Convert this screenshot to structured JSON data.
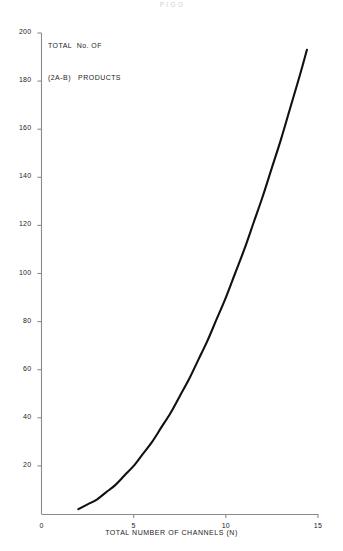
{
  "page": {
    "header_fragment": "P        I        G         G"
  },
  "chart_data": {
    "type": "line",
    "title": "TOTAL  No. OF\n(2A-B)   PRODUCTS",
    "title_lines": [
      "TOTAL  No. OF",
      "(2A-B)   PRODUCTS"
    ],
    "xlabel": "TOTAL  NUMBER OF  CHANNELS  (N)",
    "ylabel": "",
    "xlim": [
      0,
      15
    ],
    "ylim": [
      0,
      200
    ],
    "grid": false,
    "legend": null,
    "xticks": [
      0,
      5,
      10,
      15
    ],
    "xtick_labels": [
      "0",
      "5",
      "10",
      "15"
    ],
    "yticks": [
      0,
      20,
      40,
      60,
      80,
      100,
      120,
      140,
      160,
      180,
      200
    ],
    "ytick_labels": [
      "0",
      "20",
      "40",
      "60",
      "80",
      "100",
      "120",
      "140",
      "160",
      "180",
      "200"
    ],
    "series": [
      {
        "name": "(2A-B) products",
        "color": "#111111",
        "x": [
          2.0,
          2.5,
          3.0,
          3.5,
          4.0,
          4.5,
          5.0,
          5.5,
          6.0,
          6.5,
          7.0,
          7.5,
          8.0,
          8.5,
          9.0,
          9.5,
          10.0,
          10.5,
          11.0,
          11.5,
          12.0,
          12.5,
          13.0,
          13.5,
          14.0,
          14.4
        ],
        "y": [
          2,
          4,
          6,
          9,
          12,
          16,
          20,
          25,
          30,
          36,
          42,
          49,
          56,
          64,
          72,
          81,
          90,
          100,
          110,
          121,
          132,
          144,
          156,
          169,
          182,
          193
        ]
      }
    ]
  },
  "axis_style": {
    "axis_color": "#8a8a8a",
    "curve_color": "#111111",
    "text_color": "#1c1c1c"
  }
}
